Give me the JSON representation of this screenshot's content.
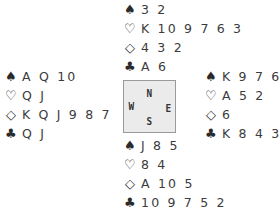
{
  "diagram": {
    "type": "bridge-deal",
    "compass": {
      "north": "N",
      "south": "S",
      "east": "E",
      "west": "W"
    },
    "suits": {
      "spades": "♠",
      "hearts": "♡",
      "diamonds": "◇",
      "clubs": "♣"
    },
    "hands": {
      "north": {
        "spades": "3 2",
        "hearts": "K 10 9 7 6 3",
        "diamonds": "4 3 2",
        "clubs": "A 6"
      },
      "west": {
        "spades": "A Q 10",
        "hearts": "Q J",
        "diamonds": "K Q J 9 8 7",
        "clubs": "Q J"
      },
      "east": {
        "spades": "K 9 7 6 4",
        "hearts": "A 5 2",
        "diamonds": "6",
        "clubs": "K 8 4 3"
      },
      "south": {
        "spades": "J 8 5",
        "hearts": "8 4",
        "diamonds": "A 10 5",
        "clubs": "10 9 7 5 2"
      }
    }
  }
}
